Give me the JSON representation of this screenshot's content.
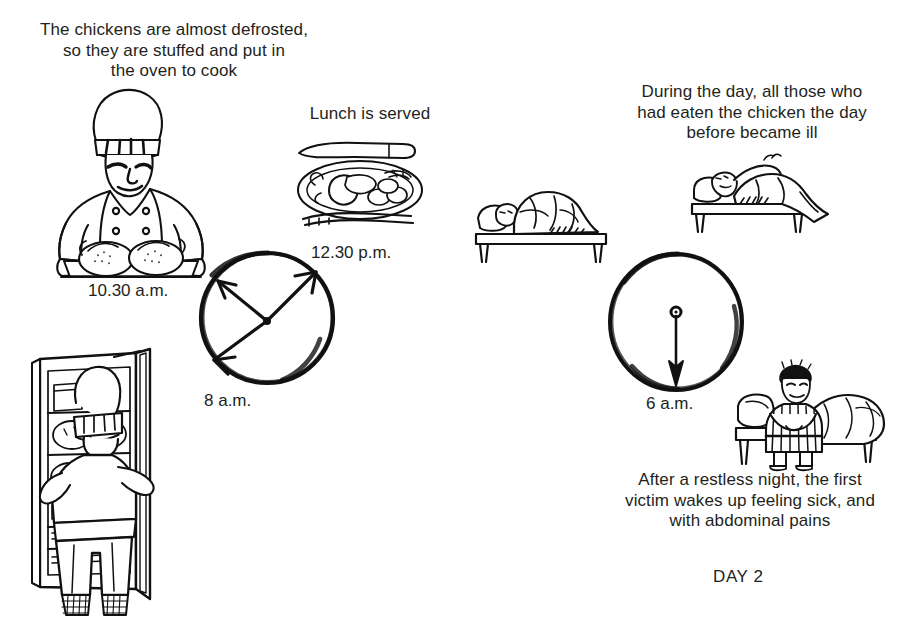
{
  "document": {
    "kind": "illustrated-timeline-diagram",
    "background_color": "#ffffff",
    "ink_color": "#231f20"
  },
  "captions": {
    "defrost": "The chickens are almost defrosted,\nso they are stuffed and put in\nthe oven to cook",
    "lunch": "Lunch is served",
    "during_day": "During the day, all those who\nhad eaten the chicken the day\nbefore became ill",
    "restless_night": "After a restless night, the first\nvictim wakes up feeling sick, and\nwith abdominal pains"
  },
  "time_labels": {
    "chef_tray": "10.30 a.m.",
    "lunch_plate": "12.30 p.m.",
    "clock_day1": "8 a.m.",
    "clock_day2": "6 a.m."
  },
  "day_marker": "DAY 2",
  "illustrations": {
    "chef_with_tray": "chef-holding-tray-of-stuffed-chickens",
    "plate_of_food": "plate-of-roast-chicken-with-knife-and-fork",
    "clock_day1": "clock-face-with-three-arrows",
    "chef_at_fridge": "chef-opening-refrigerator-with-chickens",
    "bed_left": "person-asleep-in-bed",
    "bed_right": "person-lying-awake-in-bed",
    "clock_day2": "clock-face-with-single-arrow",
    "sick_person": "person-sitting-on-bed-edge-holding-stomach"
  },
  "clocks": {
    "day1": {
      "label": "8 a.m.",
      "arrow_count": 3,
      "arrow_angles_deg": [
        302,
        40,
        222
      ],
      "arrow_targets": [
        "10.30 a.m.",
        "12.30 p.m.",
        "8 a.m."
      ]
    },
    "day2": {
      "label": "6 a.m.",
      "arrow_count": 1,
      "arrow_angles_deg": [
        90
      ],
      "arrow_targets": [
        "6 a.m."
      ]
    }
  }
}
